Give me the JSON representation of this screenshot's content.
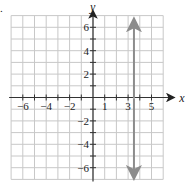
{
  "chart_data": {
    "type": "line",
    "title": "",
    "xlabel": "x",
    "ylabel": "y",
    "xlim": [
      -7,
      6
    ],
    "ylim": [
      -7,
      7
    ],
    "grid": true,
    "x_tick_labels": [
      "−6",
      "−4",
      "−2",
      "1",
      "3",
      "5"
    ],
    "x_tick_values": [
      -6,
      -4,
      -2,
      1,
      3,
      5
    ],
    "y_tick_labels": [
      "6",
      "4",
      "2",
      "−2",
      "−4",
      "−6"
    ],
    "y_tick_values": [
      6,
      4,
      2,
      -2,
      -4,
      -6
    ],
    "series": [
      {
        "name": "vertical line x = 3.5",
        "x": [
          3.5,
          3.5
        ],
        "y": [
          -6.8,
          6.6
        ],
        "color": "#8c8c8c",
        "arrows": "both"
      }
    ]
  },
  "labels": {
    "bullet": "."
  }
}
